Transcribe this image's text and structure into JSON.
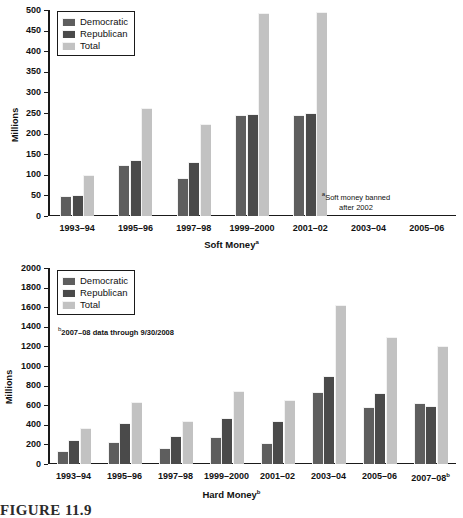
{
  "figure": {
    "caption": "FIGURE 11.9"
  },
  "legend": {
    "items": [
      {
        "label": "Democratic",
        "key": "dem",
        "color": "#5e5e5e",
        "swatch_icon": "legend-swatch-icon"
      },
      {
        "label": "Republican",
        "key": "rep",
        "color": "#4a4a4a",
        "swatch_icon": "legend-swatch-icon"
      },
      {
        "label": "Total",
        "key": "tot",
        "color": "#c2c2c2",
        "swatch_icon": "legend-swatch-icon"
      }
    ]
  },
  "chart_data": [
    {
      "id": "soft-money",
      "type": "bar",
      "title": "Soft Money",
      "title_superscript": "a",
      "xlabel": "Soft Money",
      "ylabel": "Millions",
      "ylim": [
        0,
        500
      ],
      "ytick_step": 50,
      "yticks": [
        0,
        50,
        100,
        150,
        200,
        250,
        300,
        350,
        400,
        450,
        500
      ],
      "grid": false,
      "legend_position": "top-left",
      "categories": [
        "1993–94",
        "1995–96",
        "1997–98",
        "1999–2000",
        "2001–02",
        "2003–04",
        "2005–06"
      ],
      "series": [
        {
          "name": "Democratic",
          "key": "dem",
          "values": [
            48,
            124,
            93,
            246,
            245,
            null,
            null
          ]
        },
        {
          "name": "Republican",
          "key": "rep",
          "values": [
            51,
            135,
            131,
            247,
            251,
            null,
            null
          ]
        },
        {
          "name": "Total",
          "key": "tot",
          "values": [
            99,
            262,
            224,
            493,
            496,
            null,
            null
          ]
        }
      ],
      "annotations": [
        {
          "text": "Soft money banned after 2002",
          "superscript": "a",
          "line1": "Soft money banned",
          "line2": "after 2002"
        }
      ]
    },
    {
      "id": "hard-money",
      "type": "bar",
      "title": "Hard Money",
      "title_superscript": "b",
      "xlabel": "Hard Money",
      "ylabel": "Millions",
      "ylim": [
        0,
        2000
      ],
      "ytick_step": 200,
      "yticks": [
        0,
        200,
        400,
        600,
        800,
        1000,
        1200,
        1400,
        1600,
        1800,
        2000
      ],
      "grid": false,
      "legend_position": "top-left",
      "categories": [
        "1993–94",
        "1995–96",
        "1997–98",
        "1999–2000",
        "2001–02",
        "2003–04",
        "2005–06",
        "2007–08"
      ],
      "last_category_superscript": "b",
      "series": [
        {
          "name": "Democratic",
          "key": "dem",
          "values": [
            128,
            220,
            160,
            278,
            215,
            735,
            580,
            625
          ]
        },
        {
          "name": "Republican",
          "key": "rep",
          "values": [
            240,
            415,
            285,
            465,
            440,
            895,
            720,
            590
          ]
        },
        {
          "name": "Total",
          "key": "tot",
          "values": [
            370,
            632,
            440,
            750,
            650,
            1625,
            1300,
            1205
          ]
        }
      ],
      "annotations": [
        {
          "text": "2007–08 data through 9/30/2008",
          "superscript": "b"
        }
      ]
    }
  ]
}
